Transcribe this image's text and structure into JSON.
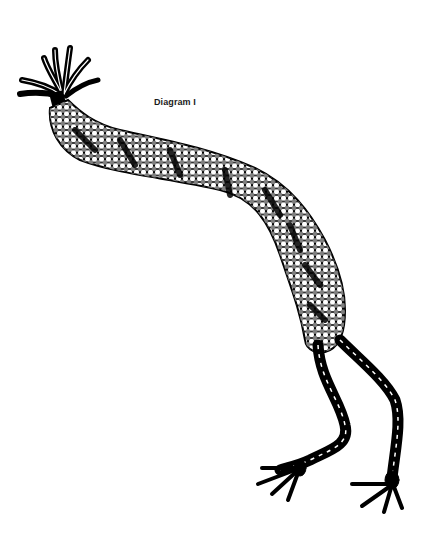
{
  "diagram": {
    "caption": "Diagram I",
    "colors": {
      "ink": "#000000",
      "paper": "#ffffff"
    },
    "parts": [
      "top-tassel",
      "beaded-body",
      "left-braided-leg",
      "right-braided-leg",
      "left-foot-tassel",
      "right-foot-tassel"
    ]
  }
}
